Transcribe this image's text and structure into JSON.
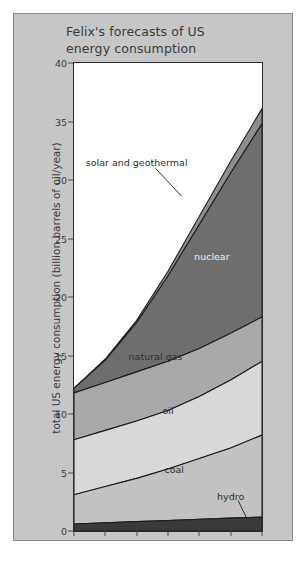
{
  "figure": {
    "title": "Felix's forecasts of US\nenergy consumption",
    "title_line1": "Felix's forecasts of US",
    "title_line2": "energy consumption",
    "background_color": "#c6c6c6",
    "plot_background_color": "#ffffff"
  },
  "chart_data": {
    "type": "area",
    "title": "Felix's forecasts of US energy consumption",
    "subtitle": "",
    "xlabel": "",
    "ylabel": "total US energy consumption (billion barrels of oil/year)",
    "x": [
      1970,
      1975,
      1980,
      1985,
      1990,
      1995,
      2000
    ],
    "xlim": [
      1970,
      2000
    ],
    "ylim": [
      0,
      40
    ],
    "yticks": [
      0,
      5,
      10,
      15,
      20,
      25,
      30,
      35,
      40
    ],
    "xticks": [
      "1970",
      "1975",
      "1980",
      "1985",
      "1990",
      "1995",
      "2000"
    ],
    "grid": false,
    "legend": "inline-labels",
    "stacked": true,
    "series": [
      {
        "name": "hydro",
        "label": "hydro",
        "color": "#3a3a3a",
        "values": [
          0.6,
          0.7,
          0.8,
          0.9,
          1.0,
          1.1,
          1.2
        ],
        "label_x": 1995,
        "label_y": 3.0
      },
      {
        "name": "coal",
        "label": "coal",
        "color": "#c2c2c2",
        "values": [
          2.5,
          3.1,
          3.7,
          4.4,
          5.2,
          6.0,
          7.0
        ],
        "label_x": 1986,
        "label_y": 5.3
      },
      {
        "name": "oil",
        "label": "oil",
        "color": "#d8d8d8",
        "values": [
          4.7,
          4.8,
          4.9,
          5.0,
          5.3,
          5.8,
          6.3
        ],
        "label_x": 1985,
        "label_y": 10.3
      },
      {
        "name": "natural gas",
        "label": "natural gas",
        "color": "#a9a9a9",
        "values": [
          4.0,
          4.1,
          4.2,
          4.2,
          4.1,
          4.0,
          3.8
        ],
        "label_x": 1983,
        "label_y": 15.0
      },
      {
        "name": "nuclear",
        "label": "nuclear",
        "color": "#6e6e6e",
        "values": [
          0.4,
          1.9,
          4.2,
          7.3,
          10.6,
          13.7,
          16.5
        ],
        "label_x": 1992,
        "label_y": 23.5
      },
      {
        "name": "solar and geothermal",
        "label": "solar and geothermal",
        "color": "#8e8e8e",
        "values": [
          0.0,
          0.1,
          0.2,
          0.4,
          0.7,
          1.0,
          1.3
        ],
        "label_x": 1980,
        "label_y": 31.5
      }
    ],
    "stack_tops": {
      "hydro": [
        0.6,
        0.7,
        0.8,
        0.9,
        1.0,
        1.1,
        1.2
      ],
      "coal": [
        3.1,
        3.8,
        4.5,
        5.3,
        6.2,
        7.1,
        8.2
      ],
      "oil": [
        7.8,
        8.6,
        9.4,
        10.3,
        11.5,
        12.9,
        14.5
      ],
      "natural_gas": [
        11.8,
        12.7,
        13.6,
        14.5,
        15.6,
        16.9,
        18.3
      ],
      "nuclear": [
        12.2,
        14.6,
        17.8,
        21.8,
        26.2,
        30.6,
        34.8
      ],
      "solar_and_geothermal": [
        12.2,
        14.7,
        18.0,
        22.2,
        26.9,
        31.6,
        36.1
      ]
    },
    "total": [
      12.2,
      14.7,
      18.0,
      22.2,
      26.9,
      31.6,
      36.1
    ],
    "annotations": [
      {
        "text": "solar and geothermal",
        "leader": true
      },
      {
        "text": "hydro",
        "leader": true
      }
    ]
  }
}
